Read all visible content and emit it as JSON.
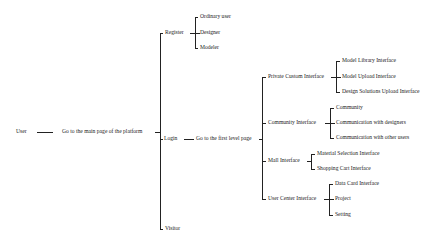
{
  "diagram": {
    "root": "User",
    "main_page": "Go to the main page of the platform",
    "level1": {
      "register": {
        "label": "Register",
        "children": [
          "Ordinary user",
          "Designer",
          "Modeler"
        ]
      },
      "login": {
        "label": "Login",
        "next": "Go to the first level page",
        "interfaces": [
          {
            "label": "Private Custom Interface",
            "children": [
              "Model Library Interface",
              "Model Upload Interface",
              "Design Solutions Upload Interface"
            ]
          },
          {
            "label": "Community Interface",
            "children": [
              "Community",
              "Communication with designers",
              "Communication with other users"
            ]
          },
          {
            "label": "Mall Interface",
            "children": [
              "Material Selection Interface",
              "Shopping Cart Interface"
            ]
          },
          {
            "label": "User Center Interface",
            "children": [
              "Data Card Interface",
              "Project",
              "Setting"
            ]
          }
        ]
      },
      "visitor": {
        "label": "Visitor"
      }
    }
  }
}
